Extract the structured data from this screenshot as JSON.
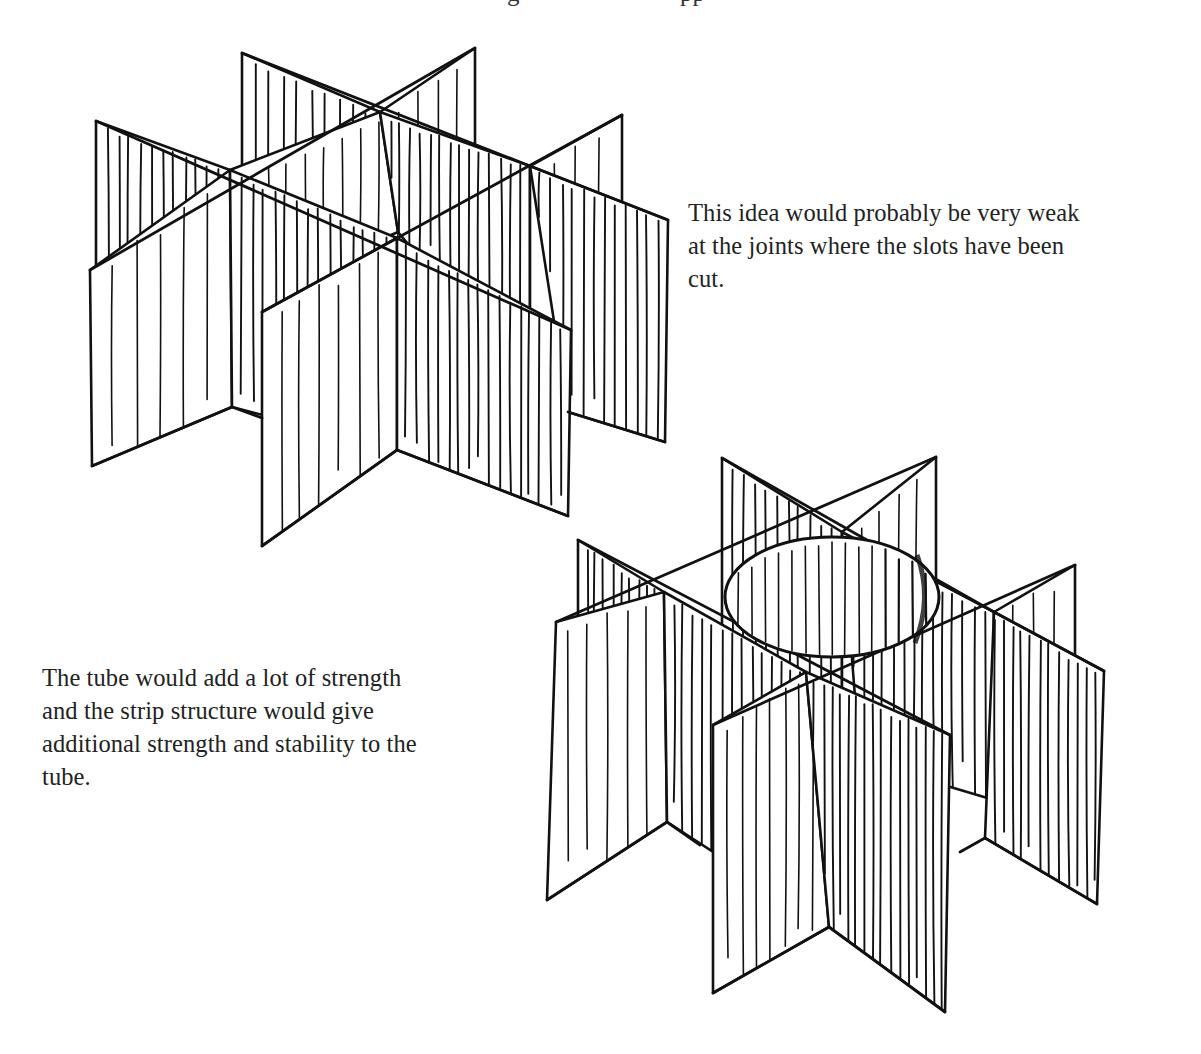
{
  "page": {
    "type": "scanned design-sketch page",
    "background": "#ffffff",
    "ink_color": "#111111"
  },
  "top_cut_line": {
    "note": "descenders of a text line cropped by the top edge",
    "fragments": [
      {
        "x": 507,
        "glyph": "g"
      },
      {
        "x": 680,
        "glyph": "pp"
      }
    ]
  },
  "captions": [
    {
      "id": "caption-weak-joints",
      "lines": [
        "This idea would probably be very weak",
        "at the joints where the slots have been",
        "cut."
      ]
    },
    {
      "id": "caption-tube-strength",
      "lines": [
        "The tube would add a lot of strength",
        "and the strip structure would give",
        "additional strength and stability to the",
        "tube."
      ]
    }
  ],
  "sketches": [
    {
      "id": "sketch-slotted-lattice",
      "description": "Isometric egg-crate lattice of four slotted strips crossing in a 2x2 pattern",
      "panels": [
        {
          "name": "back-strip-left-panel",
          "pts": [
            [
              242,
              53
            ],
            [
              380,
              112
            ],
            [
              380,
              340
            ],
            [
              242,
              300
            ]
          ],
          "hatch": 9,
          "dense": true
        },
        {
          "name": "back-strip-right-panel",
          "pts": [
            [
              380,
              112
            ],
            [
              475,
              48
            ],
            [
              475,
              290
            ],
            [
              380,
              340
            ]
          ],
          "hatch": 4,
          "dense": false
        },
        {
          "name": "left-strip-back-panel",
          "pts": [
            [
              96,
              121
            ],
            [
              230,
              170
            ],
            [
              230,
              400
            ],
            [
              96,
              320
            ]
          ],
          "hatch": 11,
          "dense": true
        },
        {
          "name": "left-strip-front-panel",
          "pts": [
            [
              90,
              270
            ],
            [
              230,
              170
            ],
            [
              232,
              407
            ],
            [
              92,
              466
            ]
          ],
          "hatch": 5,
          "dense": false
        },
        {
          "name": "center-strip-back-panel",
          "pts": [
            [
              230,
              170
            ],
            [
              380,
              112
            ],
            [
              398,
              232
            ],
            [
              240,
              300
            ]
          ],
          "hatch": 8,
          "dense": false
        },
        {
          "name": "center-diag-panel-a",
          "pts": [
            [
              230,
              170
            ],
            [
              397,
              238
            ],
            [
              397,
              450
            ],
            [
              232,
              407
            ]
          ],
          "hatch": 14,
          "dense": true
        },
        {
          "name": "center-diag-panel-b",
          "pts": [
            [
              380,
              112
            ],
            [
              530,
              166
            ],
            [
              530,
              390
            ],
            [
              398,
              232
            ]
          ],
          "hatch": 14,
          "dense": true
        },
        {
          "name": "right-back-panel",
          "pts": [
            [
              530,
              166
            ],
            [
              622,
              115
            ],
            [
              622,
              340
            ],
            [
              530,
              390
            ]
          ],
          "hatch": 3,
          "dense": false
        },
        {
          "name": "right-strip-panel",
          "pts": [
            [
              530,
              166
            ],
            [
              668,
              220
            ],
            [
              665,
              442
            ],
            [
              568,
              412
            ]
          ],
          "hatch": 12,
          "dense": true
        },
        {
          "name": "front-strip-left-panel",
          "pts": [
            [
              262,
              312
            ],
            [
              397,
              238
            ],
            [
              397,
              450
            ],
            [
              262,
              546
            ]
          ],
          "hatch": 6,
          "dense": false
        },
        {
          "name": "front-strip-right-panel",
          "pts": [
            [
              397,
              238
            ],
            [
              571,
              330
            ],
            [
              568,
              516
            ],
            [
              397,
              450
            ]
          ],
          "hatch": 16,
          "dense": true
        }
      ],
      "edges": [
        [
          [
            242,
            53
          ],
          [
            530,
            166
          ]
        ],
        [
          [
            96,
            121
          ],
          [
            571,
            330
          ]
        ],
        [
          [
            475,
            48
          ],
          [
            90,
            270
          ]
        ],
        [
          [
            622,
            115
          ],
          [
            262,
            312
          ]
        ],
        [
          [
            530,
            166
          ],
          [
            668,
            220
          ]
        ],
        [
          [
            92,
            466
          ],
          [
            232,
            407
          ]
        ],
        [
          [
            232,
            407
          ],
          [
            262,
            418
          ]
        ],
        [
          [
            262,
            546
          ],
          [
            397,
            450
          ]
        ],
        [
          [
            397,
            450
          ],
          [
            568,
            516
          ]
        ],
        [
          [
            568,
            412
          ],
          [
            665,
            442
          ]
        ]
      ]
    },
    {
      "id": "sketch-lattice-with-tube",
      "description": "Same isometric lattice with a cylindrical tube inserted at the central cell",
      "tube": {
        "cx": 832,
        "cy": 597,
        "rx": 107,
        "ry": 60
      },
      "panels": [
        {
          "name": "back-strip-left-panel",
          "pts": [
            [
              722,
              458
            ],
            [
              842,
              532
            ],
            [
              842,
              720
            ],
            [
              722,
              650
            ]
          ],
          "hatch": 10,
          "dense": true
        },
        {
          "name": "back-strip-right-panel",
          "pts": [
            [
              842,
              532
            ],
            [
              936,
              457
            ],
            [
              936,
              660
            ],
            [
              842,
              720
            ]
          ],
          "hatch": 4,
          "dense": false
        },
        {
          "name": "left-strip-back-panel",
          "pts": [
            [
              578,
              540
            ],
            [
              664,
              592
            ],
            [
              664,
              800
            ],
            [
              578,
              740
            ]
          ],
          "hatch": 9,
          "dense": true
        },
        {
          "name": "left-strip-front-panel",
          "pts": [
            [
              556,
              622
            ],
            [
              664,
              592
            ],
            [
              667,
              822
            ],
            [
              547,
              900
            ]
          ],
          "hatch": 5,
          "dense": false
        },
        {
          "name": "center-diag-panel-a",
          "pts": [
            [
              664,
              592
            ],
            [
              806,
              672
            ],
            [
              829,
              927
            ],
            [
              667,
              822
            ]
          ],
          "hatch": 16,
          "dense": true
        },
        {
          "name": "center-diag-panel-b",
          "pts": [
            [
              842,
              532
            ],
            [
              994,
              612
            ],
            [
              994,
              800
            ],
            [
              860,
              760
            ]
          ],
          "hatch": 14,
          "dense": true
        },
        {
          "name": "right-back-panel",
          "pts": [
            [
              994,
              612
            ],
            [
              1075,
              565
            ],
            [
              1075,
              760
            ],
            [
              994,
              800
            ]
          ],
          "hatch": 3,
          "dense": false
        },
        {
          "name": "right-strip-panel",
          "pts": [
            [
              994,
              612
            ],
            [
              1104,
              671
            ],
            [
              1097,
              904
            ],
            [
              985,
              838
            ]
          ],
          "hatch": 12,
          "dense": true
        },
        {
          "name": "front-strip-left-panel",
          "pts": [
            [
              713,
              725
            ],
            [
              806,
              672
            ],
            [
              829,
              927
            ],
            [
              713,
              993
            ]
          ],
          "hatch": 7,
          "dense": false
        },
        {
          "name": "front-strip-right-panel",
          "pts": [
            [
              806,
              672
            ],
            [
              950,
              735
            ],
            [
              945,
              1012
            ],
            [
              829,
              927
            ]
          ],
          "hatch": 16,
          "dense": true
        }
      ],
      "edges": [
        [
          [
            722,
            458
          ],
          [
            994,
            612
          ]
        ],
        [
          [
            578,
            540
          ],
          [
            950,
            735
          ]
        ],
        [
          [
            936,
            457
          ],
          [
            556,
            622
          ]
        ],
        [
          [
            1075,
            565
          ],
          [
            713,
            725
          ]
        ],
        [
          [
            994,
            612
          ],
          [
            1104,
            671
          ]
        ],
        [
          [
            547,
            900
          ],
          [
            667,
            822
          ]
        ],
        [
          [
            667,
            822
          ],
          [
            700,
            845
          ]
        ],
        [
          [
            713,
            993
          ],
          [
            829,
            927
          ]
        ],
        [
          [
            829,
            927
          ],
          [
            945,
            1012
          ]
        ],
        [
          [
            985,
            838
          ],
          [
            1097,
            904
          ]
        ],
        [
          [
            960,
            852
          ],
          [
            985,
            838
          ]
        ]
      ]
    }
  ]
}
